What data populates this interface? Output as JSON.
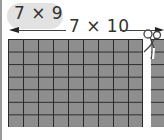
{
  "diagram": {
    "partial_product_label": "7 × 9",
    "full_product_label": "7 × 10",
    "grid": {
      "rows": 7,
      "columns_kept": 9,
      "columns_total": 10,
      "columns_cut": 1,
      "fill_color": "#8e8e8e",
      "line_color": "#2a2a2a"
    },
    "icons": [
      "scissors-icon",
      "arrow-left-icon",
      "arrow-right-icon"
    ]
  }
}
